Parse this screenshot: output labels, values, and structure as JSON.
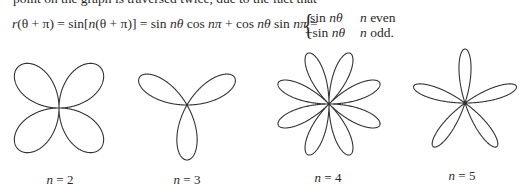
{
  "text": {
    "intro_line": "point on the graph is traversed twice, due to the fact that",
    "equation_lhs_parts": [
      "r",
      "(θ + π) = sin[",
      "n",
      "(θ + π)] = sin ",
      "nθ",
      " cos ",
      "nπ",
      " + cos ",
      "nθ",
      " sin ",
      "nπ",
      " ="
    ],
    "cases": [
      {
        "expr_prefix": "sin ",
        "expr_var": "nθ",
        "cond_var": "n",
        "cond_text": " even"
      },
      {
        "expr_prefix": "−sin ",
        "expr_var": "nθ",
        "cond_var": "n",
        "cond_text": " odd."
      }
    ]
  },
  "figures": [
    {
      "n": 2,
      "label_var": "n",
      "label_rest": " = 2",
      "cx": 59,
      "cy": 108,
      "r": 58,
      "label_x": 60,
      "label_y": 172
    },
    {
      "n": 3,
      "label_var": "n",
      "label_rest": " = 3",
      "cx": 187,
      "cy": 105,
      "r": 55,
      "label_x": 187,
      "label_y": 172
    },
    {
      "n": 4,
      "label_var": "n",
      "label_rest": " = 4",
      "cx": 329,
      "cy": 104,
      "r": 55,
      "label_x": 328,
      "label_y": 170
    },
    {
      "n": 5,
      "label_var": "n",
      "label_rest": " = 5",
      "cx": 465,
      "cy": 103,
      "r": 54,
      "label_x": 462,
      "label_y": 168
    }
  ],
  "style": {
    "curve_color": "#333333",
    "curve_width": 1.1
  }
}
